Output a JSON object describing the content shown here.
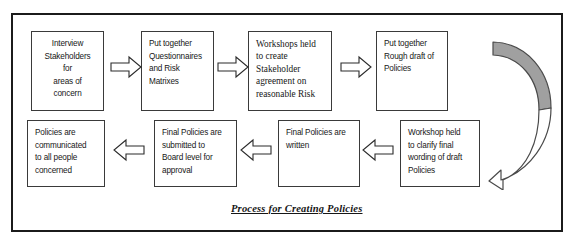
{
  "diagram": {
    "caption": "Process for Creating Policies",
    "frame_color": "#1b1b1b",
    "box_border_color": "#3a3a3a",
    "arrow_fill": "#ffffff",
    "arrow_stroke": "#2b2b2b",
    "curved_arrow_fill": "#a0a0a0",
    "curved_arrow_stroke": "#4a4a4a",
    "background": "#ffffff"
  },
  "top_row": [
    {
      "id": "interview-stakeholders",
      "lines": [
        "Interview",
        "Stakeholders for",
        "areas of concern"
      ],
      "text": "Interview Stakeholders for areas of concern",
      "align": "center",
      "font": "sans"
    },
    {
      "id": "questionnaires-risk-matrixes",
      "lines": [
        "Put together",
        "Questionnaires",
        "and Risk",
        "Matrixes"
      ],
      "text": "Put together Questionnaires and Risk Matrixes",
      "align": "left",
      "font": "sans"
    },
    {
      "id": "workshops-stakeholder-agreement",
      "lines": [
        "Workshops held",
        "to create",
        "Stakeholder",
        "agreement  on",
        "reasonable  Risk"
      ],
      "text": "Workshops held to create Stakeholder agreement on reasonable Risk",
      "align": "left",
      "font": "serif"
    },
    {
      "id": "rough-draft-policies",
      "lines": [
        "Put together",
        "Rough draft of",
        "Policies"
      ],
      "text": "Put together Rough draft of Policies",
      "align": "left",
      "font": "sans"
    }
  ],
  "bottom_row": [
    {
      "id": "policies-communicated",
      "lines": [
        "Policies are",
        "communicated",
        "to all people",
        "concerned"
      ],
      "text": "Policies are communicated to all people concerned",
      "align": "left",
      "font": "sans"
    },
    {
      "id": "submitted-board-approval",
      "lines": [
        "Final Policies are",
        "submitted to",
        "Board level for",
        "approval"
      ],
      "text": "Final Policies are submitted to Board level for approval",
      "align": "left",
      "font": "sans"
    },
    {
      "id": "final-policies-written",
      "lines": [
        "Final Policies are",
        "written"
      ],
      "text": "Final Policies are written",
      "align": "left",
      "font": "sans"
    },
    {
      "id": "workshop-clarify-wording",
      "lines": [
        "Workshop held",
        "to clarify final",
        "wording of draft",
        "Policies"
      ],
      "text": "Workshop held to clarify final wording of draft Policies",
      "align": "left",
      "font": "sans"
    }
  ],
  "connectors": [
    {
      "id": "arrow-1-2",
      "direction": "right",
      "row": "top"
    },
    {
      "id": "arrow-2-3",
      "direction": "right",
      "row": "top"
    },
    {
      "id": "arrow-3-4",
      "direction": "right",
      "row": "top"
    },
    {
      "id": "arrow-wrap-down",
      "direction": "curved-down-left",
      "row": "right-edge"
    },
    {
      "id": "arrow-8-7",
      "direction": "left",
      "row": "bottom"
    },
    {
      "id": "arrow-7-6",
      "direction": "left",
      "row": "bottom"
    },
    {
      "id": "arrow-6-5",
      "direction": "left",
      "row": "bottom"
    }
  ]
}
